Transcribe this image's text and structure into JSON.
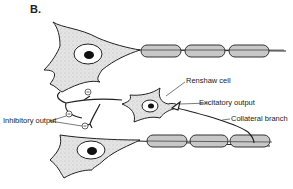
{
  "figure": {
    "panel_label": "B.",
    "labels": {
      "renshaw_cell": "Renshaw cell",
      "excitatory_output": "Excitatory output",
      "collateral_branch": "Collateral branch",
      "inhibitory_output": "Inhibitory output"
    },
    "synapse_symbol": "⊖",
    "colors": {
      "cell_fill": "#d9d9d9",
      "myelin_fill": "#bdbdbd",
      "outline": "#222222",
      "background": "#ffffff"
    }
  }
}
